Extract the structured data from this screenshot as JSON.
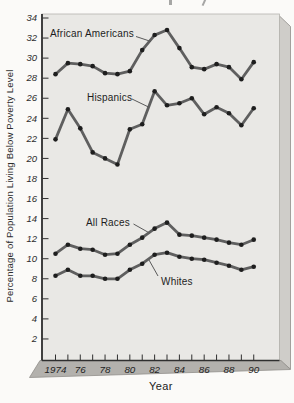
{
  "chart": {
    "y_axis_title": "Percentage of Population Living Below Poverty Level",
    "x_axis_title": "Year",
    "colors": {
      "panel": "#e9e8e5",
      "page": "#fbfaf8",
      "line": "#5f5f5f",
      "dot": "#1e1e1e",
      "axis": "#2f2f2f",
      "tick_text": "#2d2d2d",
      "bottom_face": "#b3b1ad",
      "side_face": "#cfcdc9",
      "face_edge": "#908e8a"
    }
  },
  "chart_data": {
    "type": "line",
    "title": "",
    "xlabel": "Year",
    "ylabel": "Percentage of Population Living Below Poverty Level",
    "ylim": [
      2,
      34
    ],
    "y_tick_values": [
      34,
      32,
      30,
      28,
      26,
      24,
      22,
      20,
      18,
      16,
      14,
      12,
      10,
      8,
      6,
      4,
      2
    ],
    "x_tick_labels": [
      "1974",
      "76",
      "78",
      "80",
      "82",
      "84",
      "86",
      "88",
      "90"
    ],
    "x_minor_ticks_every_year": true,
    "grid": false,
    "legend": "inline-labels",
    "x": [
      1974,
      1975,
      1976,
      1977,
      1978,
      1979,
      1980,
      1981,
      1982,
      1983,
      1984,
      1985,
      1986,
      1987,
      1988,
      1989,
      1990
    ],
    "series": [
      {
        "name": "African Americans",
        "values": [
          28.4,
          29.5,
          29.4,
          29.2,
          28.5,
          28.4,
          28.7,
          30.8,
          32.3,
          32.8,
          31.0,
          29.1,
          28.9,
          29.4,
          29.1,
          27.9,
          29.6
        ]
      },
      {
        "name": "Hispanics",
        "values": [
          21.9,
          24.9,
          23.0,
          20.6,
          20.0,
          19.4,
          22.9,
          23.4,
          26.7,
          25.3,
          25.5,
          26.0,
          24.4,
          25.1,
          24.5,
          23.3,
          25.0
        ]
      },
      {
        "name": "All Races",
        "values": [
          10.5,
          11.4,
          11.0,
          10.9,
          10.4,
          10.5,
          11.4,
          12.1,
          13.0,
          13.6,
          12.4,
          12.3,
          12.1,
          11.9,
          11.6,
          11.4,
          11.9
        ]
      },
      {
        "name": "Whites",
        "values": [
          8.3,
          8.9,
          8.3,
          8.3,
          8.0,
          8.0,
          8.9,
          9.5,
          10.4,
          10.6,
          10.2,
          10.0,
          9.9,
          9.6,
          9.3,
          8.9,
          9.2
        ]
      }
    ]
  }
}
